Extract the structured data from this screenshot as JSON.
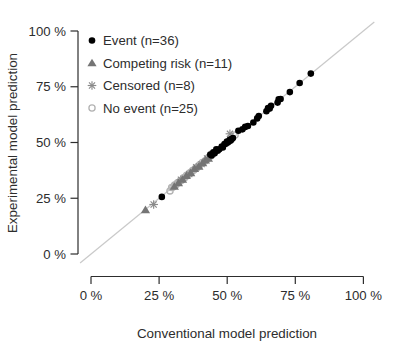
{
  "chart_data": {
    "type": "scatter",
    "title": "",
    "xlabel": "Conventional model prediction",
    "ylabel": "Experimental model prediction",
    "xlim": [
      0,
      100
    ],
    "ylim": [
      0,
      100
    ],
    "x_ticks": [
      0,
      25,
      50,
      75,
      100
    ],
    "y_ticks": [
      0,
      25,
      50,
      75,
      100
    ],
    "x_tick_labels": [
      "0 %",
      "25 %",
      "50 %",
      "75 %",
      "100 %"
    ],
    "y_tick_labels": [
      "0 %",
      "25 %",
      "50 %",
      "75 %",
      "100 %"
    ],
    "grid": false,
    "legend_position": "top-left",
    "axis_color": "#2d2d2d",
    "identity_line": {
      "slope": 1,
      "intercept": 0,
      "color": "#c9c9c9"
    },
    "series": [
      {
        "name": "No event (n=25)",
        "marker": "open-circle",
        "color": "#b3b3b3",
        "points": [
          [
            29,
            28.3
          ],
          [
            29.6,
            29.8
          ],
          [
            30.1,
            30
          ],
          [
            30.7,
            30.9
          ],
          [
            31.2,
            31
          ],
          [
            31.8,
            31.9
          ],
          [
            32.3,
            32.2
          ],
          [
            32.9,
            33
          ],
          [
            33.4,
            33.2
          ],
          [
            34,
            34.2
          ],
          [
            34.5,
            34.3
          ],
          [
            35.1,
            35.3
          ],
          [
            35.6,
            35.4
          ],
          [
            36.2,
            36.3
          ],
          [
            36.7,
            36.5
          ],
          [
            37.3,
            37.4
          ],
          [
            37.8,
            37.7
          ],
          [
            38.4,
            38.5
          ],
          [
            39,
            38.8
          ],
          [
            39.9,
            40
          ],
          [
            40.9,
            41
          ],
          [
            41.9,
            41.7
          ],
          [
            42.9,
            43.1
          ],
          [
            43.9,
            44
          ],
          [
            52.9,
            53.4
          ]
        ]
      },
      {
        "name": "Censored (n=8)",
        "marker": "asterisk",
        "color": "#8a8a8a",
        "points": [
          [
            23,
            22.2
          ],
          [
            33,
            33.3
          ],
          [
            36.1,
            35.8
          ],
          [
            38.6,
            38.9
          ],
          [
            40.6,
            40.3
          ],
          [
            42.6,
            42.9
          ],
          [
            44.6,
            44.9
          ],
          [
            51,
            53.9
          ]
        ]
      },
      {
        "name": "Competing risk (n=11)",
        "marker": "filled-triangle",
        "color": "#757575",
        "points": [
          [
            20,
            19.8
          ],
          [
            30.6,
            30.3
          ],
          [
            32.1,
            31.9
          ],
          [
            33.6,
            33.4
          ],
          [
            35,
            35.1
          ],
          [
            36.6,
            36.4
          ],
          [
            38,
            38.2
          ],
          [
            39.6,
            39.3
          ],
          [
            41,
            40.8
          ],
          [
            42,
            42.1
          ],
          [
            43.1,
            42.8
          ]
        ]
      },
      {
        "name": "Event (n=36)",
        "marker": "filled-circle",
        "color": "#000000",
        "points": [
          [
            26,
            25.6
          ],
          [
            43.8,
            44.6
          ],
          [
            44.3,
            44.2
          ],
          [
            44.9,
            45.6
          ],
          [
            45.4,
            45.2
          ],
          [
            46,
            46.9
          ],
          [
            46.5,
            46.3
          ],
          [
            47.1,
            47
          ],
          [
            48,
            48.2
          ],
          [
            48.4,
            47.8
          ],
          [
            49,
            49.3
          ],
          [
            49.5,
            49.4
          ],
          [
            49.9,
            50.4
          ],
          [
            50.2,
            50
          ],
          [
            50.6,
            50.5
          ],
          [
            51,
            51.3
          ],
          [
            51.3,
            50.9
          ],
          [
            51.7,
            51.6
          ],
          [
            52.1,
            52
          ],
          [
            54.1,
            55.3
          ],
          [
            55.6,
            55.9
          ],
          [
            56.6,
            57
          ],
          [
            57.6,
            57.4
          ],
          [
            59.6,
            59
          ],
          [
            61,
            60.8
          ],
          [
            61.6,
            61.9
          ],
          [
            64.4,
            64
          ],
          [
            65,
            65.4
          ],
          [
            65.6,
            65.2
          ],
          [
            66.1,
            66.5
          ],
          [
            68.5,
            67.9
          ],
          [
            68.9,
            69.4
          ],
          [
            69.6,
            69.5
          ],
          [
            73,
            72.6
          ],
          [
            76.6,
            76.7
          ],
          [
            80.7,
            80.9
          ]
        ]
      }
    ],
    "legend": [
      {
        "label": "Event (n=36)",
        "marker": "filled-circle",
        "color": "#000000"
      },
      {
        "label": "Competing risk (n=11)",
        "marker": "filled-triangle",
        "color": "#757575"
      },
      {
        "label": "Censored (n=8)",
        "marker": "asterisk",
        "color": "#8a8a8a"
      },
      {
        "label": "No event (n=25)",
        "marker": "open-circle",
        "color": "#b3b3b3"
      }
    ]
  }
}
